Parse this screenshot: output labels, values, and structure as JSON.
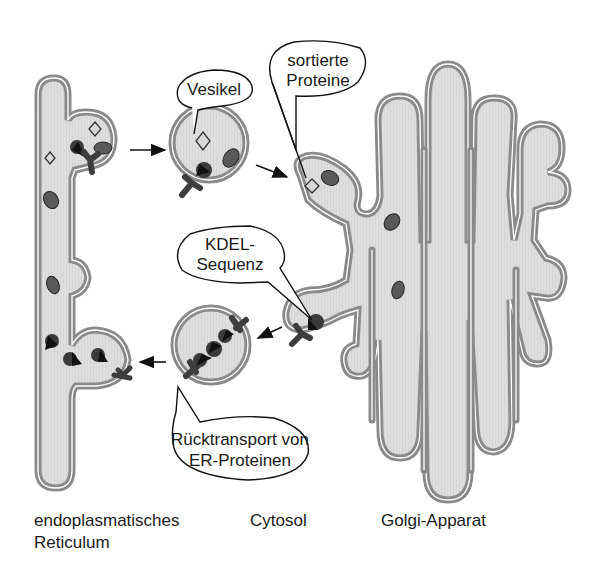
{
  "diagram": {
    "type": "biology-schematic",
    "colors": {
      "membrane": "#8a8a8a",
      "lumen": "#dcdcdc",
      "protein_dark": "#4a4a4a",
      "protein_black": "#111111",
      "cargo_light": "#d8d8d8",
      "background": "#ffffff",
      "text": "#1a1a1a"
    },
    "callouts": {
      "vesikel": {
        "line1": "Vesikel"
      },
      "sortierte_proteine": {
        "line1": "sortierte",
        "line2": "Proteine"
      },
      "kdel": {
        "line1": "KDEL-",
        "line2": "Sequenz"
      },
      "ruecktransport": {
        "line1": "Rücktransport von",
        "line2": "ER-Proteinen"
      }
    },
    "regions": {
      "er": {
        "line1": "endoplasmatisches",
        "line2": "Reticulum"
      },
      "cytosol": {
        "line1": "Cytosol"
      },
      "golgi": {
        "line1": "Golgi-Apparat"
      }
    },
    "flows": [
      {
        "from": "ER",
        "to": "vesicle-anterograde",
        "direction": "right"
      },
      {
        "from": "vesicle-anterograde",
        "to": "Golgi",
        "direction": "right"
      },
      {
        "from": "Golgi",
        "to": "vesicle-retrograde",
        "direction": "left"
      },
      {
        "from": "vesicle-retrograde",
        "to": "ER",
        "direction": "left"
      }
    ]
  }
}
